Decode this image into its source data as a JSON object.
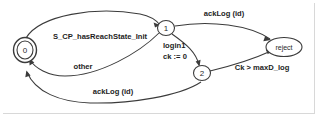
{
  "diagram": {
    "type": "state-machine",
    "title": "",
    "width": 315,
    "height": 114,
    "background_color": "#ffffff",
    "stroke_color": "#3b3b3b",
    "text_color": "#1d1d1d",
    "nodes": [
      {
        "id": "0",
        "label": "0",
        "shape": "double-circle",
        "is_initial": true,
        "cx": 25,
        "cy": 50
      },
      {
        "id": "1",
        "label": "1",
        "shape": "circle",
        "is_initial": false,
        "cx": 166,
        "cy": 28
      },
      {
        "id": "2",
        "label": "2",
        "shape": "circle",
        "is_initial": false,
        "cx": 202,
        "cy": 73
      },
      {
        "id": "reject",
        "label": "reject",
        "shape": "ellipse",
        "is_initial": false,
        "cx": 284,
        "cy": 47
      }
    ],
    "edges": [
      {
        "id": "e0",
        "from": "0",
        "to": "1",
        "label": "S_CP_hasReachState_Init",
        "label_x": 100,
        "label_y": 36
      },
      {
        "id": "e1",
        "from": "1",
        "to": "reject",
        "label": "ackLog (id)",
        "label_x": 224,
        "label_y": 13
      },
      {
        "id": "e2",
        "from": "1",
        "to": "2",
        "label_line1": "login1",
        "label_line2": "ck := 0",
        "label_x": 178,
        "label_y": 49
      },
      {
        "id": "e3",
        "from": "1",
        "to": "0",
        "label": "other",
        "label_x": 83,
        "label_y": 66
      },
      {
        "id": "e4",
        "from": "2",
        "to": "reject",
        "label": "Ck > maxD_log",
        "label_x": 262,
        "label_y": 67
      },
      {
        "id": "e5",
        "from": "2",
        "to": "0",
        "label": "ackLog (id)",
        "label_x": 113,
        "label_y": 91
      }
    ]
  }
}
